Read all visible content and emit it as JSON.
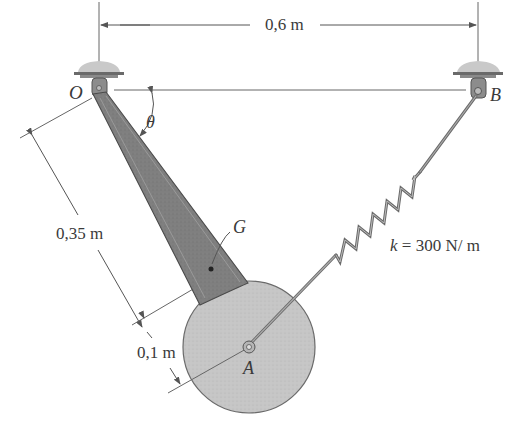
{
  "diagram": {
    "type": "mechanics-figure",
    "labels": {
      "point_o": "O",
      "point_b": "B",
      "point_a": "A",
      "point_g": "G",
      "angle": "θ",
      "span_dimension": "0,6 m",
      "bar_length_dimension": "0,35 m",
      "disk_radius_dimension": "0,1 m",
      "spring_constant": "k = 300 N/ m"
    },
    "colors": {
      "bar_fill": "#7d7d7d",
      "bar_edge": "#4a4a4a",
      "disk_fill": "#c4c4c4",
      "disk_edge": "#6a6a6a",
      "line": "#555555",
      "ground": "#c8c8c8",
      "text": "#3a3a3a"
    }
  }
}
